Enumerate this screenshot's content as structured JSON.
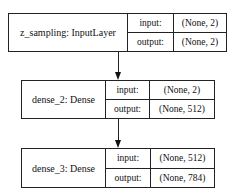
{
  "diagram": {
    "type": "keras-model-plot",
    "nodes": [
      {
        "id": "z_sampling",
        "label": "z_sampling: InputLayer",
        "input_label": "input:",
        "input_shape": "(None, 2)",
        "output_label": "output:",
        "output_shape": "(None, 2)"
      },
      {
        "id": "dense_2",
        "label": "dense_2: Dense",
        "input_label": "input:",
        "input_shape": "(None, 2)",
        "output_label": "output:",
        "output_shape": "(None, 512)"
      },
      {
        "id": "dense_3",
        "label": "dense_3: Dense",
        "input_label": "input:",
        "input_shape": "(None, 512)",
        "output_label": "output:",
        "output_shape": "(None, 784)"
      }
    ],
    "edges": [
      {
        "from": "z_sampling",
        "to": "dense_2"
      },
      {
        "from": "dense_2",
        "to": "dense_3"
      }
    ],
    "colors": {
      "stroke": "#222222",
      "background": "#ffffff",
      "text": "#111111"
    }
  }
}
